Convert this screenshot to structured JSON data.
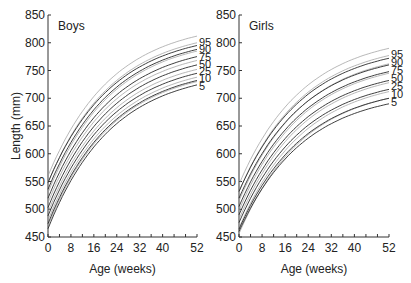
{
  "chart_data": [
    {
      "type": "line",
      "title": "Boys",
      "xlabel": "Age (weeks)",
      "ylabel": "Length (mm)",
      "xlim": [
        0,
        52
      ],
      "ylim": [
        450,
        850
      ],
      "xticks": [
        0,
        8,
        16,
        24,
        32,
        40,
        52
      ],
      "yticks": [
        450,
        500,
        550,
        600,
        650,
        700,
        750,
        800,
        850
      ],
      "grid": false,
      "legend_position": "right-end labels",
      "percentile_labels": [
        "95",
        "90",
        "75",
        "50",
        "25",
        "10",
        "5"
      ],
      "x": [
        0,
        4,
        8,
        12,
        16,
        20,
        24,
        28,
        32,
        36,
        40,
        44,
        48,
        52
      ],
      "series": [
        {
          "name": "95 (set A)",
          "start": 560,
          "end": 812
        },
        {
          "name": "90 (set A)",
          "start": 548,
          "end": 800
        },
        {
          "name": "75 (set A)",
          "start": 530,
          "end": 785
        },
        {
          "name": "50 (set A)",
          "start": 512,
          "end": 768
        },
        {
          "name": "25 (set A)",
          "start": 495,
          "end": 752
        },
        {
          "name": "10 (set A)",
          "start": 480,
          "end": 738
        },
        {
          "name": "5 (set A)",
          "start": 470,
          "end": 730
        },
        {
          "name": "95 (set B)",
          "start": 548,
          "end": 795
        },
        {
          "name": "90 (set B)",
          "start": 536,
          "end": 788
        },
        {
          "name": "75 (set B)",
          "start": 520,
          "end": 775
        },
        {
          "name": "50 (set B)",
          "start": 503,
          "end": 760
        },
        {
          "name": "25 (set B)",
          "start": 488,
          "end": 745
        },
        {
          "name": "10 (set B)",
          "start": 474,
          "end": 732
        },
        {
          "name": "5 (set B)",
          "start": 465,
          "end": 724
        }
      ]
    },
    {
      "type": "line",
      "title": "Girls",
      "xlabel": "Age (weeks)",
      "ylabel": "",
      "xlim": [
        0,
        52
      ],
      "ylim": [
        450,
        850
      ],
      "xticks": [
        0,
        8,
        16,
        24,
        32,
        40,
        52
      ],
      "yticks": [
        450,
        500,
        550,
        600,
        650,
        700,
        750,
        800,
        850
      ],
      "grid": false,
      "legend_position": "right-end labels",
      "percentile_labels": [
        "95",
        "90",
        "75",
        "50",
        "25",
        "10",
        "5"
      ],
      "x": [
        0,
        4,
        8,
        12,
        16,
        20,
        24,
        28,
        32,
        36,
        40,
        44,
        48,
        52
      ],
      "series": [
        {
          "name": "95 (set A)",
          "start": 545,
          "end": 790
        },
        {
          "name": "90 (set A)",
          "start": 532,
          "end": 777
        },
        {
          "name": "75 (set A)",
          "start": 515,
          "end": 762
        },
        {
          "name": "50 (set A)",
          "start": 498,
          "end": 745
        },
        {
          "name": "25 (set A)",
          "start": 482,
          "end": 728
        },
        {
          "name": "10 (set A)",
          "start": 466,
          "end": 712
        },
        {
          "name": "5 (set A)",
          "start": 456,
          "end": 700
        },
        {
          "name": "95 (set B)",
          "start": 532,
          "end": 772
        },
        {
          "name": "90 (set B)",
          "start": 520,
          "end": 760
        },
        {
          "name": "75 (set B)",
          "start": 505,
          "end": 748
        },
        {
          "name": "50 (set B)",
          "start": 490,
          "end": 732
        },
        {
          "name": "25 (set B)",
          "start": 476,
          "end": 716
        },
        {
          "name": "10 (set B)",
          "start": 464,
          "end": 700
        },
        {
          "name": "5 (set B)",
          "start": 460,
          "end": 690
        }
      ]
    }
  ],
  "panels": {
    "boys": {
      "title": "Boys"
    },
    "girls": {
      "title": "Girls"
    }
  },
  "axes": {
    "xlabel": "Age (weeks)",
    "ylabel": "Length (mm)"
  },
  "colors": {
    "set_a": "#9a9a9a",
    "set_b": "#2a2a2a",
    "axis": "#333333"
  }
}
